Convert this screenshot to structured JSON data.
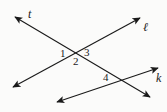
{
  "figure": {
    "type": "geometry-diagram",
    "background_color": "#fbfbfa",
    "stroke_color": "#1a1a1a",
    "width": 167,
    "height": 112
  },
  "lines": [
    {
      "id": "t",
      "label": "t",
      "arrows": "both",
      "from": {
        "x": 15,
        "y": 17
      },
      "to": {
        "x": 150,
        "y": 97
      },
      "label_pos": {
        "x": 28,
        "y": 8
      }
    },
    {
      "id": "l",
      "label": "ℓ",
      "arrows": "both",
      "from": {
        "x": 13,
        "y": 87
      },
      "to": {
        "x": 140,
        "y": 18
      },
      "label_pos": {
        "x": 143,
        "y": 21
      }
    },
    {
      "id": "k",
      "label": "k",
      "arrows": "both",
      "from": {
        "x": 57,
        "y": 102
      },
      "to": {
        "x": 158,
        "y": 68
      },
      "label_pos": {
        "x": 156,
        "y": 72
      }
    }
  ],
  "intersections": [
    {
      "id": "t-l",
      "x": 77,
      "y": 53,
      "lines": [
        "t",
        "l"
      ]
    },
    {
      "id": "t-k",
      "x": 120,
      "y": 78,
      "lines": [
        "t",
        "k"
      ]
    }
  ],
  "angles": [
    {
      "id": "angle-1",
      "label": "1",
      "x": 60,
      "y": 48,
      "at": "t-l"
    },
    {
      "id": "angle-2",
      "label": "2",
      "x": 73,
      "y": 56,
      "at": "t-l"
    },
    {
      "id": "angle-3",
      "label": "3",
      "x": 84,
      "y": 47,
      "at": "t-l"
    },
    {
      "id": "angle-4",
      "label": "4",
      "x": 103,
      "y": 72,
      "at": "t-k"
    }
  ]
}
